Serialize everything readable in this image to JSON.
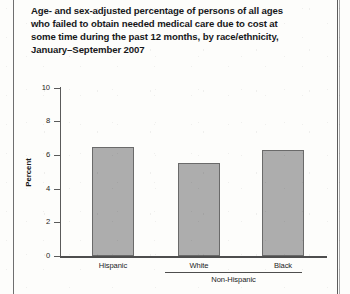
{
  "title_lines": [
    "Age- and sex-adjusted percentage of persons of all ages",
    "who failed to obtain needed medical care due to cost at",
    "some time during the past 12 months, by race/ethnicity,",
    "January–September 2007"
  ],
  "group_bracket_label": "Non-Hispanic",
  "colors": {
    "bar_fill": "#adadad",
    "bar_border": "#6a6a6a",
    "axis": "#4e4e4e",
    "text": "#17181a"
  },
  "chart_data": {
    "type": "bar",
    "xlabel": "",
    "ylabel": "Percent",
    "categories": [
      "Hispanic",
      "White",
      "Black"
    ],
    "values": [
      6.5,
      5.5,
      6.3
    ],
    "ylim": [
      0,
      10
    ],
    "yticks": [
      0,
      2,
      4,
      6,
      8,
      10
    ],
    "ytick_labels": [
      "0",
      "2",
      "4",
      "6",
      "8",
      "10"
    ],
    "grid": false,
    "legend": "none",
    "annotations": [
      {
        "text": "Non-Hispanic",
        "spans_categories": [
          "White",
          "Black"
        ]
      }
    ]
  }
}
